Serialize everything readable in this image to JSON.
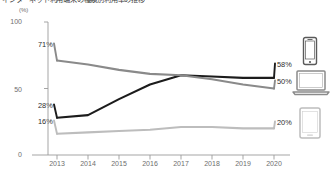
{
  "chart_data": {
    "type": "line",
    "title": "インターネット利用端末の種類別利用率の推移",
    "unit_label": "(%)",
    "xlabel": "",
    "ylabel": "",
    "ylim": [
      0,
      100
    ],
    "yticks": [
      0,
      50,
      100
    ],
    "grid": false,
    "legend_position": "right-icons",
    "categories": [
      "2013",
      "2014",
      "2015",
      "2016",
      "2017",
      "2018",
      "2019",
      "2020"
    ],
    "x": [
      2013,
      2014,
      2015,
      2016,
      2017,
      2018,
      2019,
      2020
    ],
    "series": [
      {
        "name": "smartphone",
        "icon": "smartphone-icon",
        "color": "#1c1c1c",
        "values": [
          28,
          30,
          42,
          53,
          60,
          59,
          58,
          58
        ],
        "start_label": "28%",
        "end_label": "58%"
      },
      {
        "name": "pc-laptop",
        "icon": "laptop-icon",
        "color": "#8a8a8a",
        "values": [
          71,
          68,
          64,
          61,
          60,
          57,
          53,
          50
        ],
        "start_label": "71%",
        "end_label": "50%"
      },
      {
        "name": "tablet",
        "icon": "tablet-icon",
        "color": "#bdbdbd",
        "values": [
          16,
          17,
          18,
          19,
          21,
          21,
          20,
          20
        ],
        "start_label": "16%",
        "end_label": "20%"
      }
    ]
  },
  "axis": {
    "y_top": "100",
    "y_mid": "50",
    "y_bottom": "0"
  },
  "xticks": {
    "t0": "2013",
    "t1": "2014",
    "t2": "2015",
    "t3": "2016",
    "t4": "2017",
    "t5": "2018",
    "t6": "2019",
    "t7": "2020"
  },
  "labels": {
    "left_smartphone": "28%",
    "left_pc": "71%",
    "left_tablet": "16%",
    "right_smartphone": "58%",
    "right_pc": "50%",
    "right_tablet": "20%"
  },
  "colors": {
    "smartphone": "#1c1c1c",
    "pc": "#8a8a8a",
    "tablet": "#bdbdbd",
    "axis": "#9b9b9b",
    "text": "#4a4a4a"
  }
}
